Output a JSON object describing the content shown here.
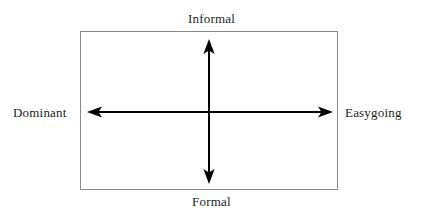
{
  "diagram": {
    "type": "two-axis-quadrant-grid",
    "title_visible": false,
    "background_color": "#ffffff",
    "frame": {
      "name": "quadrant-box",
      "stroke_color": "#8a8a8a",
      "stroke_width": 1,
      "x": 80,
      "y": 31,
      "width": 258,
      "height": 159
    },
    "center_point": {
      "x": 209,
      "y": 112
    },
    "axes": [
      {
        "name": "vertical-axis",
        "orientation": "vertical",
        "style": "double-headed-arrow",
        "color": "#000000",
        "line_width": 2,
        "from": {
          "x": 209,
          "y": 183
        },
        "to": {
          "x": 209,
          "y": 40
        },
        "positive_label": "Informal",
        "negative_label": "Formal"
      },
      {
        "name": "horizontal-axis",
        "orientation": "horizontal",
        "style": "double-headed-arrow",
        "color": "#000000",
        "line_width": 2,
        "from": {
          "x": 88,
          "y": 112
        },
        "to": {
          "x": 332,
          "y": 112
        },
        "positive_label": "Easygoing",
        "negative_label": "Dominant"
      }
    ],
    "labels": {
      "top": "Informal",
      "bottom": "Formal",
      "left": "Dominant",
      "right": "Easygoing"
    }
  }
}
